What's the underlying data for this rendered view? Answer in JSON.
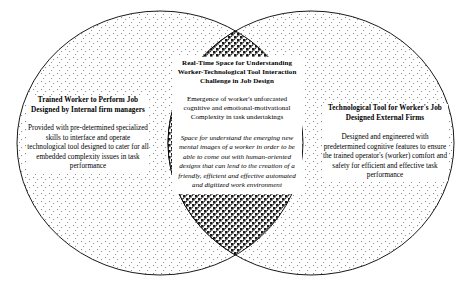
{
  "diagram": {
    "type": "venn",
    "colors": {
      "outline": "#000000",
      "text": "#000000",
      "background": "#ffffff",
      "circle_fill_stipple": "#7a7a7a",
      "intersection_stipple": "#111111"
    },
    "left_circle": {
      "title": "Trained Worker to Perform Job Designed by Internal firm managers",
      "body": "Provided with pre-determined specialized skills to interface and operate technological tool designed to cater for all embedded complexity issues in task performance"
    },
    "right_circle": {
      "title": "Technological Tool for Worker's Job Designed External Firms",
      "body": "Designed and engineered with predetermined cognitive features to ensure the trained operator's (worker) comfort and safety for efficient and effective task performance"
    },
    "intersection": {
      "title": "Real-Time Space for Understanding Worker-Technological Tool Interaction Challenge in Job Design",
      "body": "Emergence of worker's unforcasted cognitive and emotional-motivational Complexity in task undertakings",
      "body_italic": "Space for understand the emerging new mental images of a worker in order to be able to come out with human-oriented designs that can lend to the creation of a friendly, efficient and effective automated and digitized work environment"
    }
  }
}
